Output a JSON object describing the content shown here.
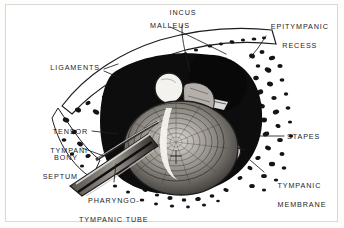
{
  "figure": {
    "kind": "anatomical-illustration",
    "style": "black-and-white stipple and line engraving",
    "border_color": "#d8d8d4",
    "ink_color": "#1d1d1d",
    "background_color": "#ffffff"
  },
  "labels": [
    {
      "id": "malleus",
      "text": "MALLEUS",
      "align": "center"
    },
    {
      "id": "incus",
      "text": "INCUS",
      "align": "center"
    },
    {
      "id": "epitympanic_recess",
      "line1": "EPITYMPANIC",
      "line2": "RECESS",
      "align": "center"
    },
    {
      "id": "ligaments",
      "text": "LIGAMENTS",
      "align": "right"
    },
    {
      "id": "tensor_tympani",
      "line1": "TENSOR",
      "line2": "TYMPANI",
      "align": "right"
    },
    {
      "id": "bony_septum",
      "line1": "BONY",
      "line2": "SEPTUM",
      "align": "right"
    },
    {
      "id": "stapes",
      "text": "STAPES",
      "align": "left"
    },
    {
      "id": "tympanic_membrane",
      "line1": "TYMPANIC",
      "line2": "MEMBRANE",
      "align": "left"
    },
    {
      "id": "pharyngotympanic_tube",
      "line1": "PHARYNGO-",
      "line2": "TYMPANIC TUBE",
      "line3": "(AUDITORY)",
      "align": "center"
    }
  ]
}
